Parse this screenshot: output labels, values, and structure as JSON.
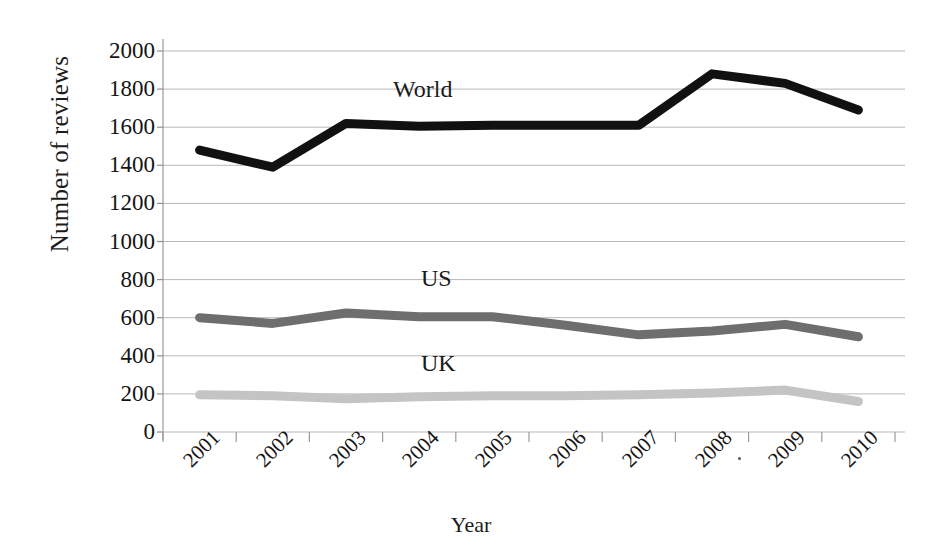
{
  "chart_data": {
    "type": "line",
    "title": "",
    "xlabel": "Year",
    "ylabel": "Number of reviews",
    "categories": [
      "2001",
      "2002",
      "2003",
      "2004",
      "2005",
      "2006",
      "2007",
      "2008",
      "2009",
      "2010"
    ],
    "ylim": [
      0,
      2000
    ],
    "y_ticks": [
      2000,
      1800,
      1600,
      1400,
      1200,
      1000,
      800,
      600,
      400,
      200,
      0
    ],
    "grid": "horizontal",
    "legend_position": "inline-annotations",
    "series": [
      {
        "name": "World",
        "color": "#111111",
        "width": 9,
        "values": [
          1480,
          1390,
          1620,
          1605,
          1610,
          1610,
          1610,
          1880,
          1830,
          1690
        ]
      },
      {
        "name": "US",
        "color": "#6e6e6e",
        "width": 9,
        "values": [
          600,
          570,
          625,
          605,
          605,
          560,
          510,
          530,
          565,
          500
        ]
      },
      {
        "name": "UK",
        "color": "#c4c4c4",
        "width": 9,
        "values": [
          195,
          190,
          175,
          185,
          190,
          190,
          195,
          205,
          220,
          160
        ]
      }
    ],
    "annotations": [
      {
        "text": "World",
        "x_px": 393,
        "y_px": 76
      },
      {
        "text": "US",
        "x_px": 421,
        "y_px": 265
      },
      {
        "text": "UK",
        "x_px": 421,
        "y_px": 350
      }
    ]
  },
  "axis": {
    "y_title": "Number of reviews",
    "x_title": "Year"
  }
}
